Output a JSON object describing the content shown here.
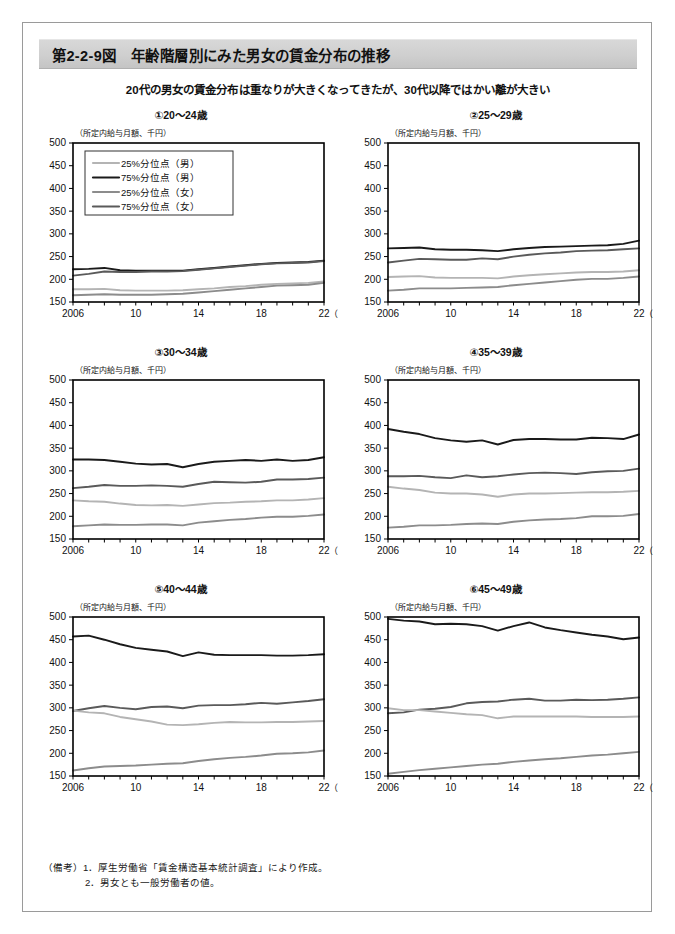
{
  "figure": {
    "title": "第2-2-9図　年齢階層別にみた男女の賃金分布の推移",
    "subtitle": "20代の男女の賃金分布は重なりが大きくなってきたが、30代以降ではかい離が大きい",
    "notes_label": "（備考）",
    "notes": [
      "1．厚生労働省「賃金構造基本統計調査」により作成。",
      "2．男女とも一般労働者の値。"
    ],
    "colors": {
      "p25_male": "#b4b4b4",
      "p75_male": "#1a1a1a",
      "p75_female": "#5a5a5a",
      "p25_female": "#8c8c8c",
      "axis": "#000000",
      "banner": "#cfcfcf",
      "frame": "#9a9a9a"
    }
  },
  "legend": {
    "panel_index": 0,
    "entries": [
      {
        "label": "25%分位点（男）",
        "key": "p25_male",
        "color": "#b4b4b4"
      },
      {
        "label": "75%分位点（男）",
        "key": "p75_male",
        "color": "#1a1a1a"
      },
      {
        "label": "25%分位点（女）",
        "key": "p25_female",
        "color": "#8c8c8c"
      },
      {
        "label": "75%分位点（女）",
        "key": "p75_female",
        "color": "#5a5a5a"
      }
    ]
  },
  "axes": {
    "ylabel": "（所定内給与月額、千円）",
    "xlabel": "（年）",
    "yticks": [
      150,
      200,
      250,
      300,
      350,
      400,
      450,
      500
    ],
    "ylim": [
      150,
      500
    ],
    "xlim": [
      2006,
      2022
    ],
    "xticks": [
      2006,
      2007,
      2008,
      2009,
      2010,
      2011,
      2012,
      2013,
      2014,
      2015,
      2016,
      2017,
      2018,
      2019,
      2020,
      2021,
      2022
    ],
    "xtick_labels": [
      {
        "x": 2006,
        "label": "2006"
      },
      {
        "x": 2010,
        "label": "10"
      },
      {
        "x": 2014,
        "label": "14"
      },
      {
        "x": 2018,
        "label": "18"
      },
      {
        "x": 2022,
        "label": "22"
      }
    ],
    "grid": false
  },
  "chart_data": [
    {
      "id": "panel-1",
      "type": "line",
      "title": "①20～24歳",
      "xlabel": "（年）",
      "ylabel": "（所定内給与月額、千円）",
      "ylim": [
        150,
        500
      ],
      "x": [
        2006,
        2007,
        2008,
        2009,
        2010,
        2011,
        2012,
        2013,
        2014,
        2015,
        2016,
        2017,
        2018,
        2019,
        2020,
        2021,
        2022
      ],
      "series": [
        {
          "name": "75%分位点（男）",
          "key": "p75_male",
          "color": "#1a1a1a",
          "values": [
            222,
            223,
            225,
            220,
            219,
            219,
            219,
            219,
            222,
            225,
            228,
            231,
            234,
            236,
            237,
            238,
            241
          ]
        },
        {
          "name": "75%分位点（女）",
          "key": "p75_female",
          "color": "#5a5a5a",
          "values": [
            208,
            212,
            217,
            216,
            216,
            217,
            217,
            218,
            221,
            224,
            227,
            230,
            233,
            235,
            236,
            237,
            240
          ]
        },
        {
          "name": "25%分位点（男）",
          "key": "p25_male",
          "color": "#b4b4b4",
          "values": [
            178,
            178,
            179,
            176,
            175,
            175,
            175,
            176,
            178,
            180,
            183,
            185,
            188,
            190,
            191,
            192,
            195
          ]
        },
        {
          "name": "25%分位点（女）",
          "key": "p25_female",
          "color": "#8c8c8c",
          "values": [
            165,
            166,
            167,
            166,
            166,
            166,
            167,
            168,
            171,
            174,
            177,
            180,
            183,
            186,
            187,
            188,
            192
          ]
        }
      ]
    },
    {
      "id": "panel-2",
      "type": "line",
      "title": "②25～29歳",
      "xlabel": "（年）",
      "ylabel": "（所定内給与月額、千円）",
      "ylim": [
        150,
        500
      ],
      "x": [
        2006,
        2007,
        2008,
        2009,
        2010,
        2011,
        2012,
        2013,
        2014,
        2015,
        2016,
        2017,
        2018,
        2019,
        2020,
        2021,
        2022
      ],
      "series": [
        {
          "name": "75%分位点（男）",
          "key": "p75_male",
          "color": "#1a1a1a",
          "values": [
            268,
            269,
            270,
            266,
            265,
            265,
            264,
            262,
            266,
            269,
            271,
            272,
            273,
            274,
            275,
            278,
            285
          ]
        },
        {
          "name": "75%分位点（女）",
          "key": "p75_female",
          "color": "#5a5a5a",
          "values": [
            237,
            241,
            245,
            244,
            243,
            243,
            246,
            244,
            250,
            254,
            257,
            259,
            262,
            263,
            264,
            266,
            268
          ]
        },
        {
          "name": "25%分位点（男）",
          "key": "p25_male",
          "color": "#b4b4b4",
          "values": [
            205,
            206,
            207,
            204,
            203,
            203,
            203,
            202,
            206,
            209,
            211,
            213,
            215,
            216,
            216,
            217,
            220
          ]
        },
        {
          "name": "25%分位点（女）",
          "key": "p25_female",
          "color": "#8c8c8c",
          "values": [
            175,
            177,
            180,
            180,
            180,
            181,
            182,
            183,
            187,
            190,
            193,
            196,
            199,
            201,
            201,
            203,
            206
          ]
        }
      ]
    },
    {
      "id": "panel-3",
      "type": "line",
      "title": "③30～34歳",
      "xlabel": "（年）",
      "ylabel": "（所定内給与月額、千円）",
      "ylim": [
        150,
        500
      ],
      "x": [
        2006,
        2007,
        2008,
        2009,
        2010,
        2011,
        2012,
        2013,
        2014,
        2015,
        2016,
        2017,
        2018,
        2019,
        2020,
        2021,
        2022
      ],
      "series": [
        {
          "name": "75%分位点（男）",
          "key": "p75_male",
          "color": "#1a1a1a",
          "values": [
            325,
            325,
            324,
            320,
            316,
            314,
            315,
            308,
            315,
            320,
            322,
            324,
            322,
            325,
            322,
            324,
            330
          ]
        },
        {
          "name": "75%分位点（女）",
          "key": "p75_female",
          "color": "#5a5a5a",
          "values": [
            262,
            265,
            269,
            267,
            267,
            268,
            267,
            265,
            271,
            276,
            275,
            274,
            276,
            281,
            281,
            282,
            285
          ]
        },
        {
          "name": "25%分位点（男）",
          "key": "p25_male",
          "color": "#b4b4b4",
          "values": [
            235,
            233,
            232,
            228,
            225,
            224,
            225,
            223,
            226,
            229,
            230,
            232,
            233,
            235,
            235,
            237,
            240
          ]
        },
        {
          "name": "25%分位点（女）",
          "key": "p25_female",
          "color": "#8c8c8c",
          "values": [
            178,
            180,
            182,
            181,
            181,
            182,
            182,
            180,
            186,
            189,
            192,
            194,
            197,
            199,
            199,
            201,
            204
          ]
        }
      ]
    },
    {
      "id": "panel-4",
      "type": "line",
      "title": "④35～39歳",
      "xlabel": "（年）",
      "ylabel": "（所定内給与月額、千円）",
      "ylim": [
        150,
        500
      ],
      "x": [
        2006,
        2007,
        2008,
        2009,
        2010,
        2011,
        2012,
        2013,
        2014,
        2015,
        2016,
        2017,
        2018,
        2019,
        2020,
        2021,
        2022
      ],
      "series": [
        {
          "name": "75%分位点（男）",
          "key": "p75_male",
          "color": "#1a1a1a",
          "values": [
            392,
            386,
            381,
            372,
            367,
            364,
            367,
            358,
            368,
            370,
            370,
            369,
            369,
            373,
            372,
            370,
            380
          ]
        },
        {
          "name": "75%分位点（女）",
          "key": "p75_female",
          "color": "#5a5a5a",
          "values": [
            288,
            288,
            289,
            286,
            284,
            290,
            286,
            288,
            292,
            295,
            296,
            295,
            293,
            297,
            299,
            300,
            305
          ]
        },
        {
          "name": "25%分位点（男）",
          "key": "p25_male",
          "color": "#b4b4b4",
          "values": [
            265,
            261,
            258,
            252,
            250,
            250,
            248,
            243,
            248,
            250,
            250,
            251,
            252,
            253,
            253,
            254,
            256
          ]
        },
        {
          "name": "25%分位点（女）",
          "key": "p25_female",
          "color": "#8c8c8c",
          "values": [
            175,
            177,
            180,
            180,
            181,
            183,
            184,
            183,
            188,
            191,
            193,
            194,
            196,
            200,
            200,
            201,
            205
          ]
        }
      ]
    },
    {
      "id": "panel-5",
      "type": "line",
      "title": "⑤40～44歳",
      "xlabel": "（年）",
      "ylabel": "（所定内給与月額、千円）",
      "ylim": [
        150,
        500
      ],
      "x": [
        2006,
        2007,
        2008,
        2009,
        2010,
        2011,
        2012,
        2013,
        2014,
        2015,
        2016,
        2017,
        2018,
        2019,
        2020,
        2021,
        2022
      ],
      "series": [
        {
          "name": "75%分位点（男）",
          "key": "p75_male",
          "color": "#1a1a1a",
          "values": [
            457,
            459,
            450,
            440,
            432,
            428,
            424,
            414,
            422,
            417,
            416,
            416,
            416,
            415,
            415,
            416,
            418
          ]
        },
        {
          "name": "75%分位点（女）",
          "key": "p75_female",
          "color": "#5a5a5a",
          "values": [
            293,
            299,
            304,
            300,
            297,
            302,
            303,
            299,
            305,
            306,
            306,
            308,
            311,
            309,
            312,
            315,
            319
          ]
        },
        {
          "name": "25%分位点（男）",
          "key": "p25_male",
          "color": "#b4b4b4",
          "values": [
            294,
            290,
            288,
            280,
            275,
            270,
            263,
            262,
            264,
            267,
            269,
            268,
            268,
            269,
            269,
            270,
            271
          ]
        },
        {
          "name": "25%分位点（女）",
          "key": "p25_female",
          "color": "#8c8c8c",
          "values": [
            162,
            167,
            171,
            172,
            173,
            175,
            177,
            178,
            183,
            187,
            190,
            192,
            195,
            199,
            200,
            202,
            206
          ]
        }
      ]
    },
    {
      "id": "panel-6",
      "type": "line",
      "title": "⑥45～49歳",
      "xlabel": "（年）",
      "ylabel": "（所定内給与月額、千円）",
      "ylim": [
        150,
        500
      ],
      "x": [
        2006,
        2007,
        2008,
        2009,
        2010,
        2011,
        2012,
        2013,
        2014,
        2015,
        2016,
        2017,
        2018,
        2019,
        2020,
        2021,
        2022
      ],
      "series": [
        {
          "name": "75%分位点（男）",
          "key": "p75_male",
          "color": "#1a1a1a",
          "values": [
            496,
            492,
            490,
            484,
            485,
            484,
            480,
            470,
            480,
            488,
            477,
            471,
            466,
            461,
            457,
            451,
            455
          ]
        },
        {
          "name": "75%分位点（女）",
          "key": "p75_female",
          "color": "#5a5a5a",
          "values": [
            288,
            290,
            296,
            298,
            302,
            310,
            313,
            314,
            318,
            320,
            316,
            316,
            318,
            317,
            318,
            320,
            323
          ]
        },
        {
          "name": "25%分位点（男）",
          "key": "p25_male",
          "color": "#b4b4b4",
          "values": [
            299,
            295,
            295,
            292,
            289,
            286,
            284,
            277,
            281,
            281,
            281,
            281,
            281,
            280,
            280,
            280,
            281
          ]
        },
        {
          "name": "25%分位点（女）",
          "key": "p25_female",
          "color": "#8c8c8c",
          "values": [
            155,
            159,
            163,
            166,
            169,
            172,
            175,
            177,
            181,
            184,
            187,
            189,
            192,
            195,
            197,
            200,
            203
          ]
        }
      ]
    }
  ]
}
